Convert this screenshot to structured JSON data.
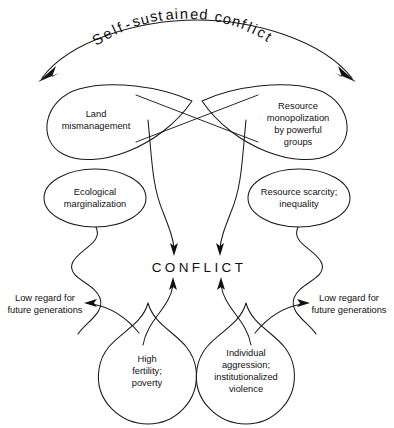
{
  "figure": {
    "center_node": "CONFLICT",
    "background_color": "#ffffff",
    "line_color": "#1a1a1a"
  },
  "nodes": {
    "top_left": {
      "lines": [
        "Land",
        "mismanagement"
      ],
      "name": "land-mismanagement"
    },
    "top_right": {
      "lines": [
        "Resource",
        "monopolization",
        "by powerful",
        "groups"
      ],
      "name": "resource-monopolization"
    },
    "mid_left": {
      "lines": [
        "Ecological",
        "marginalization"
      ],
      "name": "ecological-marginalization"
    },
    "mid_right": {
      "lines": [
        "Resource scarcity;",
        "inequality"
      ],
      "name": "resource-scarcity"
    },
    "bottom_left_loop": {
      "lines": [
        "High",
        "fertility;",
        "poverty"
      ],
      "name": "high-fertility-poverty"
    },
    "bottom_right_loop": {
      "lines": [
        "Individual",
        "aggression;",
        "institutionalized",
        "violence"
      ],
      "name": "individual-aggression"
    },
    "side_left": {
      "lines": [
        "Low regard for",
        "future generations"
      ],
      "name": "low-regard-left"
    },
    "side_right": {
      "lines": [
        "Low regard for",
        "future generations"
      ],
      "name": "low-regard-right"
    }
  },
  "title_chars": [
    {
      "ch": "S",
      "x": 96,
      "y": 46,
      "rot": -31
    },
    {
      "ch": "e",
      "x": 106,
      "y": 40,
      "rot": -28
    },
    {
      "ch": "l",
      "x": 115,
      "y": 35,
      "rot": -25
    },
    {
      "ch": "f",
      "x": 120,
      "y": 33,
      "rot": -23
    },
    {
      "ch": "-",
      "x": 127,
      "y": 30,
      "rot": -21
    },
    {
      "ch": "s",
      "x": 134,
      "y": 27,
      "rot": -18
    },
    {
      "ch": "u",
      "x": 142,
      "y": 25,
      "rot": -15
    },
    {
      "ch": "s",
      "x": 151,
      "y": 22,
      "rot": -12
    },
    {
      "ch": "t",
      "x": 159,
      "y": 21,
      "rot": -9
    },
    {
      "ch": "a",
      "x": 166,
      "y": 20,
      "rot": -6
    },
    {
      "ch": "i",
      "x": 175,
      "y": 19,
      "rot": -4
    },
    {
      "ch": "n",
      "x": 180,
      "y": 19,
      "rot": -2
    },
    {
      "ch": "e",
      "x": 190,
      "y": 19,
      "rot": 2
    },
    {
      "ch": "d",
      "x": 199,
      "y": 19,
      "rot": 5
    },
    {
      "ch": "c",
      "x": 214,
      "y": 21,
      "rot": 11
    },
    {
      "ch": "o",
      "x": 222,
      "y": 23,
      "rot": 14
    },
    {
      "ch": "n",
      "x": 231,
      "y": 25,
      "rot": 17
    },
    {
      "ch": "f",
      "x": 240,
      "y": 28,
      "rot": 21
    },
    {
      "ch": "l",
      "x": 246,
      "y": 31,
      "rot": 24
    },
    {
      "ch": "i",
      "x": 251,
      "y": 33,
      "rot": 26
    },
    {
      "ch": "c",
      "x": 256,
      "y": 35,
      "rot": 29
    },
    {
      "ch": "t",
      "x": 264,
      "y": 40,
      "rot": 33
    }
  ]
}
